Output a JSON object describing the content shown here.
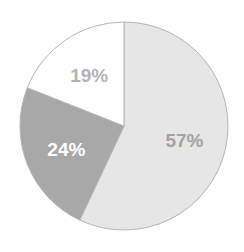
{
  "chart_data": {
    "type": "pie",
    "title": "",
    "start": "top",
    "direction": "clockwise",
    "slices": [
      {
        "label": "57%",
        "value": 57,
        "fill": "#e6e6e6",
        "text_color": "#a3a3a3"
      },
      {
        "label": "24%",
        "value": 24,
        "fill": "#a8a8a8",
        "text_color": "#ffffff"
      },
      {
        "label": "19%",
        "value": 19,
        "fill": "#ffffff",
        "text_color": "#b3b3b3"
      }
    ],
    "outline_color": "#b5b5b5"
  }
}
